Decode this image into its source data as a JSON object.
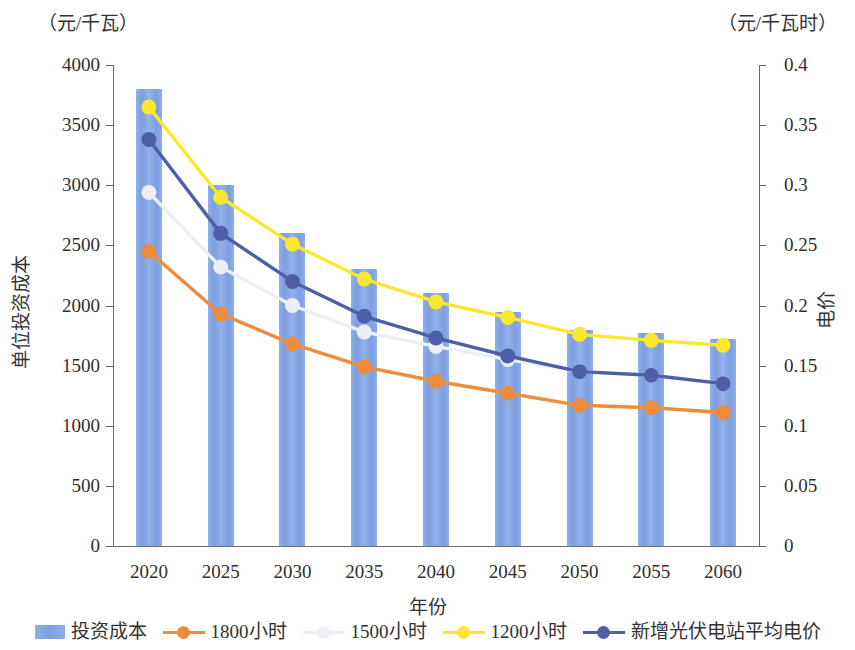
{
  "axes": {
    "left_unit": "（元/千瓦）",
    "right_unit": "（元/千瓦时）",
    "left_title": "单位投资成本",
    "right_title": "电价",
    "x_title": "年份"
  },
  "legend": {
    "items": [
      {
        "label": "投资成本",
        "type": "bar",
        "color": "#7c9fe2"
      },
      {
        "label": "1800小时",
        "type": "line",
        "color": "#ed8d3c"
      },
      {
        "label": "1500小时",
        "type": "line",
        "color": "#eceff5"
      },
      {
        "label": "1200小时",
        "type": "line",
        "color": "#fbe82e"
      },
      {
        "label": "新增光伏电站平均电价",
        "type": "line",
        "color": "#4c5fa8"
      }
    ]
  },
  "chart_data": {
    "type": "bar",
    "title": "",
    "xlabel": "年份",
    "ylabel": "单位投资成本",
    "y2label": "电价",
    "y_unit": "（元/千瓦）",
    "y2_unit": "（元/千瓦时）",
    "grid": false,
    "legend_position": "bottom",
    "categories": [
      "2020",
      "2025",
      "2030",
      "2035",
      "2040",
      "2045",
      "2050",
      "2055",
      "2060"
    ],
    "ylim": [
      0,
      4000
    ],
    "yticks": [
      0,
      500,
      1000,
      1500,
      2000,
      2500,
      3000,
      3500,
      4000
    ],
    "ytick_labels": [
      "0",
      "500",
      "1000",
      "1500",
      "2000",
      "2500",
      "3000",
      "3500",
      "4000"
    ],
    "y2lim": [
      0,
      0.4
    ],
    "y2ticks": [
      0,
      0.05,
      0.1,
      0.15,
      0.2,
      0.25,
      0.3,
      0.35,
      0.4
    ],
    "y2tick_labels": [
      "0",
      "0.05",
      "0.1",
      "0.15",
      "0.2",
      "0.25",
      "0.3",
      "0.35",
      "0.4"
    ],
    "series": [
      {
        "name": "投资成本",
        "kind": "bar",
        "axis": "left",
        "color": "#7c9fe2",
        "values": [
          3800,
          3000,
          2600,
          2300,
          2100,
          1950,
          1800,
          1770,
          1720
        ]
      },
      {
        "name": "1800小时",
        "kind": "line",
        "axis": "right",
        "color": "#ed8d3c",
        "values": [
          0.245,
          0.193,
          0.168,
          0.149,
          0.137,
          0.127,
          0.117,
          0.115,
          0.111
        ]
      },
      {
        "name": "1500小时",
        "kind": "line",
        "axis": "right",
        "color": "#eceff5",
        "values": [
          0.294,
          0.232,
          0.2,
          0.178,
          0.166,
          0.155,
          0.145,
          0.142,
          0.135
        ]
      },
      {
        "name": "1200小时",
        "kind": "line",
        "axis": "right",
        "color": "#fbe82e",
        "values": [
          0.365,
          0.29,
          0.251,
          0.222,
          0.203,
          0.19,
          0.176,
          0.171,
          0.167
        ]
      },
      {
        "name": "新增光伏电站平均电价",
        "kind": "line",
        "axis": "right",
        "color": "#4c5fa8",
        "values": [
          0.338,
          0.26,
          0.22,
          0.191,
          0.173,
          0.158,
          0.145,
          0.142,
          0.135
        ]
      }
    ]
  }
}
